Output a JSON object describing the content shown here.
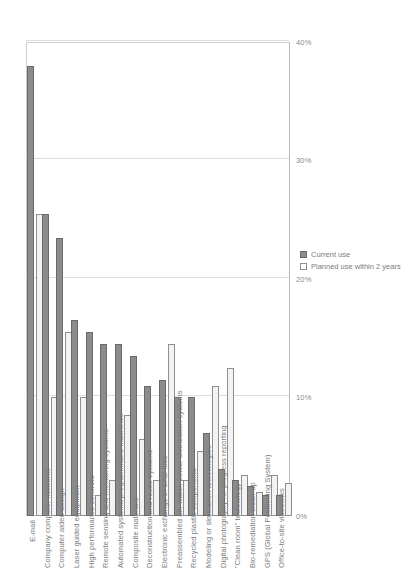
{
  "chart_data": {
    "type": "bar",
    "title": "",
    "xlabel": "",
    "ylabel": "",
    "orientation": "vertical-rotated",
    "grid": true,
    "legend_position": "bottom-right",
    "ylim": [
      0,
      40
    ],
    "tick_labels": [
      "0%",
      "10%",
      "20%",
      "30%",
      "40%"
    ],
    "tick_values": [
      0,
      10,
      20,
      30,
      40
    ],
    "categories": [
      "E-mail",
      "Company computer networks",
      "Computer aided design",
      "Laser guided equipment",
      "High performance concrete",
      "Remote sensing and monitoring systems",
      "Automated systems/programmable machines",
      "Composite materials",
      "Deconstruction and reuse systems",
      "Electronic exchange of CAD files",
      "Preassembled air, water, power distribution systems",
      "Recycled plastic components",
      "Modeling or simulation technologies",
      "Digital photography for progress reporting",
      "\"Clean room\" technology",
      "Bio-remediation clean-up",
      "GPS (Global Positioning System)",
      "Office-to-site videolinks"
    ],
    "series": [
      {
        "name": "Current use",
        "color": "#8c8c8c",
        "values": [
          38.0,
          25.5,
          23.5,
          16.5,
          15.5,
          14.5,
          14.5,
          13.5,
          11.0,
          11.5,
          10.0,
          10.0,
          7.0,
          4.0,
          3.0,
          2.5,
          1.8,
          1.8
        ]
      },
      {
        "name": "Planned use within 2 years",
        "color": "#f3f3f3",
        "values": [
          25.5,
          10.0,
          15.5,
          10.0,
          1.8,
          3.0,
          8.5,
          6.5,
          3.0,
          14.5,
          3.0,
          5.5,
          11.0,
          12.5,
          3.5,
          2.0,
          3.5,
          2.8
        ]
      }
    ]
  },
  "legend": {
    "items": [
      {
        "label": "Current use"
      },
      {
        "label": "Planned use within 2 years"
      }
    ]
  }
}
